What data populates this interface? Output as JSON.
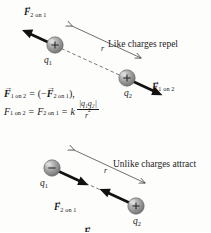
{
  "figure": {
    "background_color": "#fdfdfc",
    "ink_color": "#1a1a1a",
    "panels": [
      {
        "id": "repel",
        "caption": "Like charges repel",
        "charge1": {
          "label_q": "q",
          "label_sub": "1",
          "sign": "+"
        },
        "charge2": {
          "label_q": "q",
          "label_sub": "2",
          "sign": "+"
        },
        "separation_label": "r",
        "force_on_1": {
          "vector": "F",
          "subscript": "2 on 1"
        },
        "force_on_2": {
          "vector": "F",
          "subscript": "1 on 2"
        }
      },
      {
        "id": "attract",
        "caption": "Unlike charges attract",
        "charge1": {
          "label_q": "q",
          "label_sub": "1",
          "sign": "−"
        },
        "charge2": {
          "label_q": "q",
          "label_sub": "2",
          "sign": "+"
        },
        "separation_label": "r",
        "force_on_1": {
          "vector": "F",
          "subscript": "2 on 1"
        },
        "force_on_2": {
          "vector": "F",
          "subscript": "1 on 2"
        }
      }
    ],
    "equations": {
      "line1": {
        "lhs_vector": "F",
        "lhs_sub": "1 on 2",
        "equals": "=",
        "open": "(−",
        "rhs_vector": "F",
        "rhs_sub": "2 on 1",
        "close": "),"
      },
      "line2": {
        "lhs": "F",
        "lhs_sub": "1 on 2",
        "equals1": "=",
        "mid": "F",
        "mid_sub": "2 on 1",
        "equals2": "=",
        "k": "k",
        "numerator": "|q₁q₂|",
        "denominator": "r",
        "denominator_exp": "2"
      }
    },
    "arrow_glyph": "→"
  }
}
